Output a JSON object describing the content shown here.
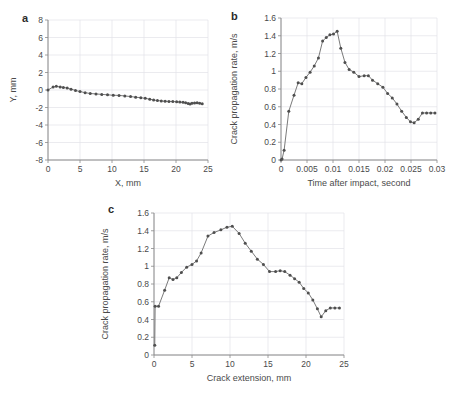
{
  "figure": {
    "panels": [
      {
        "letter": "a",
        "xlabel": "X, mm",
        "ylabel": "Y, mm"
      },
      {
        "letter": "b",
        "xlabel": "Time after impact, second",
        "ylabel": "Crack propagation rate, m/s"
      },
      {
        "letter": "c",
        "xlabel": "Crack extension, mm",
        "ylabel": "Crack propagation rate, m/s"
      }
    ],
    "colors": {
      "line": "#6b6b6b",
      "marker": "#4f4f4f",
      "grid": "#e3e3e8",
      "axis": "#8a8a8a",
      "text": "#4a4a4a"
    }
  },
  "chart_data": [
    {
      "type": "line",
      "panel": "a",
      "title": "",
      "xlabel": "X, mm",
      "ylabel": "Y, mm",
      "xlim": [
        0,
        25
      ],
      "ylim": [
        -8,
        8
      ],
      "xticks": [
        0,
        5,
        10,
        15,
        20,
        25
      ],
      "yticks": [
        -8,
        -6,
        -4,
        -2,
        0,
        2,
        4,
        6,
        8
      ],
      "xticklabels": [
        "0",
        "5",
        "10",
        "15",
        "20",
        "25"
      ],
      "yticklabels": [
        "-8",
        "-6",
        "-4",
        "-2",
        "0",
        "2",
        "4",
        "6",
        "8"
      ],
      "grid": true,
      "legend": "none",
      "markers": true,
      "x": [
        0.0,
        0.8,
        1.3,
        1.9,
        2.4,
        3.0,
        3.6,
        4.3,
        5.0,
        5.8,
        6.6,
        7.5,
        8.4,
        9.3,
        10.2,
        11.1,
        12.0,
        12.9,
        13.7,
        14.5,
        15.2,
        15.9,
        16.5,
        17.1,
        17.7,
        18.3,
        18.9,
        19.5,
        20.1,
        20.6,
        21.1,
        21.5,
        21.9,
        22.2,
        22.5,
        22.9,
        23.3,
        23.7,
        24.1
      ],
      "y": [
        0.0,
        0.35,
        0.42,
        0.35,
        0.3,
        0.22,
        0.1,
        -0.05,
        -0.18,
        -0.3,
        -0.4,
        -0.45,
        -0.5,
        -0.55,
        -0.6,
        -0.62,
        -0.68,
        -0.75,
        -0.82,
        -0.88,
        -0.95,
        -1.05,
        -1.15,
        -1.2,
        -1.25,
        -1.28,
        -1.3,
        -1.32,
        -1.35,
        -1.38,
        -1.4,
        -1.45,
        -1.55,
        -1.6,
        -1.52,
        -1.48,
        -1.45,
        -1.5,
        -1.58
      ]
    },
    {
      "type": "line",
      "panel": "b",
      "title": "",
      "xlabel": "Time after impact, second",
      "ylabel": "Crack propagation rate, m/s",
      "xlim": [
        0,
        0.03
      ],
      "ylim": [
        0,
        1.6
      ],
      "xticks": [
        0,
        0.005,
        0.01,
        0.015,
        0.02,
        0.025,
        0.03
      ],
      "yticks": [
        0,
        0.2,
        0.4,
        0.6,
        0.8,
        1,
        1.2,
        1.4,
        1.6
      ],
      "xticklabels": [
        "0",
        "0.005",
        "0.01",
        "0.015",
        "0.02",
        "0.025",
        "0.03"
      ],
      "yticklabels": [
        "0",
        "0.2",
        "0.4",
        "0.6",
        "0.8",
        "1",
        "1.2",
        "1.4",
        "1.6"
      ],
      "grid": true,
      "legend": "none",
      "markers": true,
      "x": [
        0.0,
        0.0002,
        0.0006,
        0.0015,
        0.0025,
        0.0033,
        0.004,
        0.0048,
        0.0056,
        0.0064,
        0.0072,
        0.008,
        0.0087,
        0.0094,
        0.0101,
        0.0108,
        0.0115,
        0.0123,
        0.0131,
        0.014,
        0.015,
        0.016,
        0.0168,
        0.0176,
        0.0186,
        0.0196,
        0.0205,
        0.0214,
        0.0223,
        0.0232,
        0.0241,
        0.0249,
        0.0256,
        0.0264,
        0.0272,
        0.028,
        0.0288,
        0.0296
      ],
      "y": [
        0.0,
        0.01,
        0.11,
        0.55,
        0.73,
        0.87,
        0.86,
        0.93,
        0.99,
        1.06,
        1.15,
        1.34,
        1.38,
        1.41,
        1.42,
        1.45,
        1.26,
        1.1,
        1.02,
        0.99,
        0.94,
        0.95,
        0.95,
        0.9,
        0.86,
        0.82,
        0.75,
        0.7,
        0.63,
        0.55,
        0.48,
        0.43,
        0.42,
        0.46,
        0.53,
        0.53,
        0.53,
        0.53
      ]
    },
    {
      "type": "line",
      "panel": "c",
      "title": "",
      "xlabel": "Crack extension, mm",
      "ylabel": "Crack propagation rate, m/s",
      "xlim": [
        0,
        25
      ],
      "ylim": [
        0,
        1.6
      ],
      "xticks": [
        0,
        5,
        10,
        15,
        20,
        25
      ],
      "yticks": [
        0,
        0.2,
        0.4,
        0.6,
        0.8,
        1,
        1.2,
        1.4,
        1.6
      ],
      "xticklabels": [
        "0",
        "5",
        "10",
        "15",
        "20",
        "25"
      ],
      "yticklabels": [
        "0",
        "0.2",
        "0.4",
        "0.6",
        "0.8",
        "1",
        "1.2",
        "1.4",
        "1.6"
      ],
      "grid": true,
      "legend": "none",
      "markers": true,
      "x": [
        0.1,
        0.15,
        0.6,
        1.4,
        2.0,
        2.5,
        3.0,
        3.6,
        4.3,
        5.0,
        5.6,
        6.2,
        7.1,
        7.9,
        8.8,
        9.6,
        10.3,
        11.2,
        12.0,
        12.8,
        13.6,
        14.4,
        15.2,
        16.0,
        16.6,
        17.2,
        17.9,
        18.5,
        19.1,
        19.7,
        20.3,
        20.9,
        21.5,
        22.0,
        22.6,
        23.2,
        23.8,
        24.4
      ],
      "y": [
        0.11,
        0.55,
        0.55,
        0.73,
        0.87,
        0.85,
        0.87,
        0.93,
        0.99,
        1.02,
        1.06,
        1.15,
        1.34,
        1.38,
        1.41,
        1.44,
        1.45,
        1.37,
        1.26,
        1.17,
        1.08,
        1.02,
        0.94,
        0.94,
        0.95,
        0.94,
        0.9,
        0.86,
        0.82,
        0.75,
        0.7,
        0.62,
        0.52,
        0.43,
        0.5,
        0.53,
        0.53,
        0.53
      ]
    }
  ]
}
